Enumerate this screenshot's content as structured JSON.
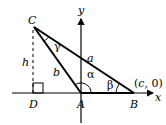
{
  "diagram": {
    "type": "triangle-on-axes",
    "points": {
      "C": {
        "label": "C",
        "x": 34,
        "y": 27
      },
      "A": {
        "label": "A",
        "x": 81,
        "y": 93
      },
      "B": {
        "label": "B",
        "x": 134,
        "y": 93
      },
      "D": {
        "label": "D",
        "x": 33,
        "y": 93
      }
    },
    "axes": {
      "x_label": "x",
      "y_label": "y"
    },
    "sides": {
      "a": "a",
      "b": "b",
      "h": "h"
    },
    "angles": {
      "alpha": "α",
      "beta": "β",
      "gamma": "γ"
    },
    "coordinate_label": {
      "open": "(",
      "var": "c",
      "rest": ", 0)"
    },
    "colors": {
      "stroke": "#000000",
      "background": "#ffffff"
    }
  }
}
